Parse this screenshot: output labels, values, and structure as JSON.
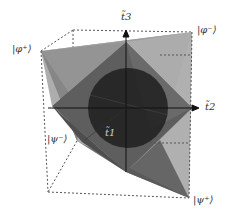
{
  "diagram": {
    "title": "",
    "axes": [
      {
        "name": "t3",
        "label": "t̃3",
        "direction": "up"
      },
      {
        "name": "t2",
        "label": "t̃2",
        "direction": "right"
      },
      {
        "name": "t1",
        "label": "t̃1",
        "direction": "front"
      }
    ],
    "vertices": [
      {
        "id": "phi-plus",
        "label": "|φ⁺⟩"
      },
      {
        "id": "phi-minus",
        "label": "|φ⁻⟩"
      },
      {
        "id": "psi-minus",
        "label": "|ψ⁻⟩"
      },
      {
        "id": "psi-plus",
        "label": "|ψ⁺⟩"
      }
    ],
    "colors": {
      "light_face": "#a6a6a6",
      "mid_face": "#7a7a7a",
      "dark_face": "#5a5a5a",
      "sphere": "#1e1e1e",
      "dashed_edge": "#555555",
      "axis": "#111111"
    }
  }
}
